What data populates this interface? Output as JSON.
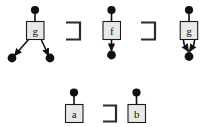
{
  "figure": {
    "background_color": "#ffffff",
    "ink_color": "#111111",
    "box_fill_color": "#e8e8e8",
    "box_stroke_color": "#1a1a1a",
    "relation_symbol": "⊐",
    "relation_symbol_name": "square-superset-or-equal",
    "rows": [
      {
        "row_id": "top-row",
        "items": [
          {
            "kind": "term-graph",
            "id": "graph-g-branching",
            "root_label": "g",
            "top_dot": true,
            "children_dots": 2,
            "description": "node g with one incoming edge from a dot above and two outgoing edges to two separate dots below"
          },
          {
            "kind": "relation",
            "id": "relation-1",
            "symbol": "⊐",
            "label": "⊐"
          },
          {
            "kind": "term-graph",
            "id": "graph-f-linear",
            "root_label": "f",
            "top_dot": true,
            "children_dots": 1,
            "description": "node f with one incoming edge from a dot above and one outgoing arrow to a dot below"
          },
          {
            "kind": "relation",
            "id": "relation-2",
            "symbol": "⊐",
            "label": "⊐"
          },
          {
            "kind": "term-graph",
            "id": "graph-g-shared",
            "root_label": "g",
            "top_dot": true,
            "children_dots": 1,
            "description": "node g with one incoming edge from a dot above and two outgoing arrows converging to a single shared dot below"
          }
        ]
      },
      {
        "row_id": "bottom-row",
        "items": [
          {
            "kind": "term-graph",
            "id": "graph-a",
            "root_label": "a",
            "top_dot": true,
            "children_dots": 0,
            "description": "constant a with one incoming edge from a dot above"
          },
          {
            "kind": "relation",
            "id": "relation-3",
            "symbol": "⊐",
            "label": "⊐"
          },
          {
            "kind": "term-graph",
            "id": "graph-b",
            "root_label": "b",
            "top_dot": true,
            "children_dots": 0,
            "description": "constant b with one incoming edge from a dot above"
          }
        ]
      }
    ],
    "labels": {
      "g1": "g",
      "f": "f",
      "g2": "g",
      "a": "a",
      "b": "b"
    }
  }
}
